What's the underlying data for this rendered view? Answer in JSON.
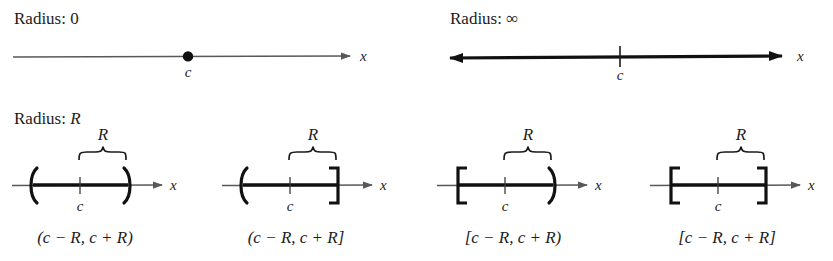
{
  "figure": {
    "title_row_1": {
      "radius_zero_label": "Radius: 0",
      "radius_infinity_label": "Radius: ∞"
    },
    "title_row_2": {
      "radius_r_label_prefix": "Radius: ",
      "radius_r_label_var": "R"
    }
  },
  "number_lines": {
    "radius_zero": {
      "axis_variable": "x",
      "center_label": "c",
      "point_style": "filled-dot",
      "arrow_ends": "right",
      "line_weight": "thin",
      "color": "#4a4a4a"
    },
    "radius_infinity": {
      "axis_variable": "x",
      "center_label": "c",
      "point_style": "tick",
      "arrow_ends": "both",
      "line_weight": "thick",
      "color": "#111111"
    }
  },
  "intervals": [
    {
      "caption": "(c − R, c + R)",
      "left_bracket": "paren",
      "right_bracket": "paren",
      "center_label": "c",
      "brace_label": "R",
      "axis_variable": "x"
    },
    {
      "caption": "(c − R, c + R]",
      "left_bracket": "paren",
      "right_bracket": "square",
      "center_label": "c",
      "brace_label": "R",
      "axis_variable": "x"
    },
    {
      "caption": "[c − R, c + R)",
      "left_bracket": "square",
      "right_bracket": "paren",
      "center_label": "c",
      "brace_label": "R",
      "axis_variable": "x"
    },
    {
      "caption": "[c − R, c + R]",
      "left_bracket": "square",
      "right_bracket": "square",
      "center_label": "c",
      "brace_label": "R",
      "axis_variable": "x"
    }
  ],
  "colors": {
    "axis_thin": "#585858",
    "interval_thick": "#111111",
    "text": "#1c1c1c"
  }
}
